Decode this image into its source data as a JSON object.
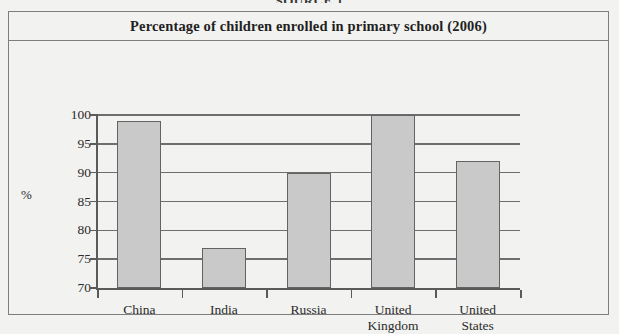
{
  "figure": {
    "caption": "SOURCE 1",
    "title": "Percentage of children enrolled in primary school (2006)"
  },
  "chart_data": {
    "type": "bar",
    "title": "Percentage of children enrolled in primary school (2006)",
    "xlabel": "",
    "ylabel": "%",
    "categories": [
      "China",
      "India",
      "Russia",
      "United\nKingdom",
      "United\nStates"
    ],
    "values": [
      99,
      77,
      90,
      100,
      92
    ],
    "ylim": [
      70,
      100
    ],
    "ytick_step": 5,
    "yticks": [
      100,
      95,
      90,
      85,
      80,
      75,
      70
    ],
    "ytick_labels": [
      "100",
      "95",
      "90",
      "85",
      "80",
      "75",
      "70"
    ],
    "grid": true,
    "legend": false,
    "bar_color": "#c9c9c9",
    "bar_edge_color": "#636363",
    "axis_color": "#5a5a5a",
    "background_color": "#f2f2f0"
  }
}
